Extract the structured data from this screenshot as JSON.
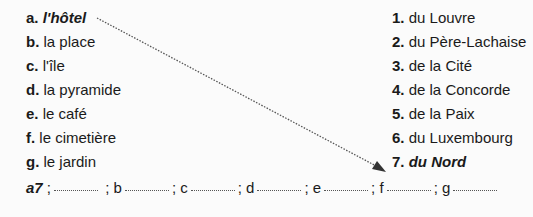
{
  "left_items": [
    {
      "label": "a.",
      "text": "l'hôtel",
      "emphasis": true
    },
    {
      "label": "b.",
      "text": "la place"
    },
    {
      "label": "c.",
      "text": "l'île"
    },
    {
      "label": "d.",
      "text": "la pyramide"
    },
    {
      "label": "e.",
      "text": "le café"
    },
    {
      "label": "f.",
      "text": "le cimetière"
    },
    {
      "label": "g.",
      "text": "le jardin"
    }
  ],
  "right_items": [
    {
      "label": "1.",
      "text": "du Louvre"
    },
    {
      "label": "2.",
      "text": "du Père-Lachaise"
    },
    {
      "label": "3.",
      "text": "de la Cité"
    },
    {
      "label": "4.",
      "text": "de la Concorde"
    },
    {
      "label": "5.",
      "text": "de la Paix"
    },
    {
      "label": "6.",
      "text": "du Luxembourg"
    },
    {
      "label": "7.",
      "text": "du Nord",
      "emphasis": true
    }
  ],
  "answers": {
    "example": "a7",
    "letters": [
      "b",
      "c",
      "d",
      "e",
      "f",
      "g"
    ],
    "separator": ";"
  }
}
